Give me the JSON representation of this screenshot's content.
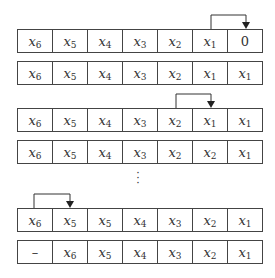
{
  "rows": [
    {
      "top": 29,
      "cells": [
        [
          "x",
          "6"
        ],
        [
          "x",
          "5"
        ],
        [
          "x",
          "4"
        ],
        [
          "x",
          "3"
        ],
        [
          "x",
          "2"
        ],
        [
          "x",
          "1"
        ],
        [
          "0",
          ""
        ]
      ]
    },
    {
      "top": 61,
      "cells": [
        [
          "x",
          "6"
        ],
        [
          "x",
          "5"
        ],
        [
          "x",
          "4"
        ],
        [
          "x",
          "3"
        ],
        [
          "x",
          "2"
        ],
        [
          "x",
          "1"
        ],
        [
          "x",
          "1"
        ]
      ]
    },
    {
      "top": 108,
      "cells": [
        [
          "x",
          "6"
        ],
        [
          "x",
          "5"
        ],
        [
          "x",
          "4"
        ],
        [
          "x",
          "3"
        ],
        [
          "x",
          "2"
        ],
        [
          "x",
          "1"
        ],
        [
          "x",
          "1"
        ]
      ]
    },
    {
      "top": 140,
      "cells": [
        [
          "x",
          "6"
        ],
        [
          "x",
          "5"
        ],
        [
          "x",
          "4"
        ],
        [
          "x",
          "3"
        ],
        [
          "x",
          "2"
        ],
        [
          "x",
          "2"
        ],
        [
          "x",
          "1"
        ]
      ]
    },
    {
      "top": 208,
      "cells": [
        [
          "x",
          "6"
        ],
        [
          "x",
          "5"
        ],
        [
          "x",
          "5"
        ],
        [
          "x",
          "4"
        ],
        [
          "x",
          "3"
        ],
        [
          "x",
          "2"
        ],
        [
          "x",
          "1"
        ]
      ]
    },
    {
      "top": 240,
      "cells": [
        [
          "–",
          ""
        ],
        [
          "x",
          "6"
        ],
        [
          "x",
          "5"
        ],
        [
          "x",
          "4"
        ],
        [
          "x",
          "3"
        ],
        [
          "x",
          "2"
        ],
        [
          "x",
          "1"
        ]
      ]
    }
  ],
  "arrows": [
    {
      "from_x": 211,
      "to_x": 246,
      "top_y": 15,
      "bottom_y": 29
    },
    {
      "from_x": 176,
      "to_x": 211,
      "top_y": 94,
      "bottom_y": 108
    },
    {
      "from_x": 34,
      "to_x": 70,
      "top_y": 194,
      "bottom_y": 208
    }
  ],
  "ellipsis": "⋮",
  "colors": {
    "line": "#444444",
    "text": "#333333"
  }
}
